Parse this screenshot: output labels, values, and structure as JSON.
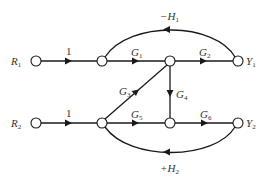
{
  "diagram": {
    "type": "signal-flow-graph",
    "nodes": [
      {
        "id": "R1",
        "label": "R",
        "sub": "1",
        "x": 36,
        "y": 61
      },
      {
        "id": "A",
        "label": "",
        "x": 102,
        "y": 61
      },
      {
        "id": "B",
        "label": "",
        "x": 170,
        "y": 61
      },
      {
        "id": "Y1",
        "label": "Y",
        "sub": "1",
        "x": 238,
        "y": 61
      },
      {
        "id": "R2",
        "label": "R",
        "sub": "2",
        "x": 36,
        "y": 123
      },
      {
        "id": "C",
        "label": "",
        "x": 102,
        "y": 123
      },
      {
        "id": "D",
        "label": "",
        "x": 170,
        "y": 123
      },
      {
        "id": "Y2",
        "label": "Y",
        "sub": "2",
        "x": 238,
        "y": 123
      }
    ],
    "edges": [
      {
        "from": "R1",
        "to": "A",
        "gain": "1"
      },
      {
        "from": "A",
        "to": "B",
        "gain": "G",
        "sub": "1"
      },
      {
        "from": "B",
        "to": "Y1",
        "gain": "G",
        "sub": "2"
      },
      {
        "from": "Y1",
        "to": "A",
        "gain": "−H",
        "sub": "1",
        "kind": "feedback-arc-top"
      },
      {
        "from": "C",
        "to": "B",
        "gain": "G",
        "sub": "3"
      },
      {
        "from": "B",
        "to": "D",
        "gain": "G",
        "sub": "4"
      },
      {
        "from": "R2",
        "to": "C",
        "gain": "1"
      },
      {
        "from": "C",
        "to": "D",
        "gain": "G",
        "sub": "5"
      },
      {
        "from": "D",
        "to": "Y2",
        "gain": "G",
        "sub": "6"
      },
      {
        "from": "Y2",
        "to": "C",
        "gain": "+H",
        "sub": "2",
        "kind": "feedback-arc-bottom"
      }
    ],
    "labels": {
      "r1": "R",
      "r1_sub": "1",
      "r2": "R",
      "r2_sub": "2",
      "y1": "Y",
      "y1_sub": "1",
      "y2": "Y",
      "y2_sub": "2",
      "gain_r1": "1",
      "gain_r2": "1",
      "g1": "G",
      "g1_sub": "1",
      "g2": "G",
      "g2_sub": "2",
      "g3": "G",
      "g3_sub": "3",
      "g4": "G",
      "g4_sub": "4",
      "g5": "G",
      "g5_sub": "5",
      "g6": "G",
      "g6_sub": "6",
      "h1": "−H",
      "h1_sub": "1",
      "h2": "+H",
      "h2_sub": "2"
    }
  }
}
